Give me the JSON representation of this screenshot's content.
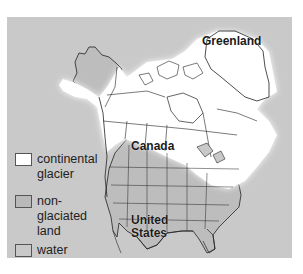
{
  "map": {
    "labels": {
      "greenland": "Greenland",
      "canada": "Canada",
      "united_states_line1": "United",
      "united_states_line2": "States"
    },
    "colors": {
      "continental_glacier": "#ffffff",
      "non_glaciated_land": "#b9b9b9",
      "water": "#c9c9c9",
      "outline": "#222222"
    }
  },
  "legend": {
    "items": [
      {
        "label_line1": "continental",
        "label_line2": "glacier",
        "color": "#ffffff"
      },
      {
        "label_line1": "non-",
        "label_line2": "glaciated",
        "label_line3": "land",
        "color": "#b9b9b9"
      },
      {
        "label_line1": "water",
        "color": "#c9c9c9"
      }
    ]
  }
}
